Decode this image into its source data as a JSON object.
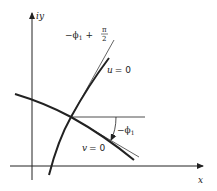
{
  "diagram": {
    "axes": {
      "y_label": "iy",
      "x_label": "x"
    },
    "curves": [
      {
        "name": "u-curve",
        "label": "u = 0",
        "label_var": "u",
        "label_eq": "= 0"
      },
      {
        "name": "v-curve",
        "label": "v = 0",
        "label_var": "v",
        "label_eq": "= 0"
      }
    ],
    "angles": {
      "upper": {
        "label": "−ϕ₁ + π/2",
        "prefix": "−ϕ",
        "sub": "1",
        "plus": "+",
        "num": "π",
        "den": "2"
      },
      "lower": {
        "label": "−ϕ₁",
        "prefix": "−ϕ",
        "sub": "1"
      }
    },
    "colors": {
      "ink": "#222222",
      "background": "#ffffff"
    }
  }
}
